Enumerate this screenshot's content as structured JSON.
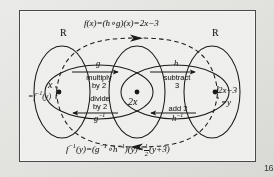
{
  "diagram": {
    "title_formula": {
      "full": "f(x)=(h∘g)(x)=2x−3",
      "f_of_x": "f(x)",
      "composition": "=(h∘g)(x)",
      "result": "=2x−3"
    },
    "bottom_formula": {
      "full": "f⁻¹(y)=(g⁻¹∘h⁻¹)(y)=½(y+3)",
      "f_inverse": "f",
      "f_inverse_exp": "−1",
      "f_inverse_arg": "(y)=(",
      "g_inverse": "g",
      "g_inverse_exp": "−1",
      "compose": "∘",
      "h_inverse": "h",
      "h_inverse_exp": "−1",
      "closing": ")(y)=",
      "frac_num": "1",
      "frac_den": "2",
      "tail": "(y+3)"
    },
    "set_labels": {
      "left": "R",
      "right": "R"
    },
    "nodes": {
      "left": {
        "value": "x",
        "sub_prefix": "=f",
        "sub_exp": "−1",
        "sub_arg": "(y)"
      },
      "middle": {
        "value": "2x"
      },
      "right": {
        "value": "2x−3",
        "sub": "=y"
      }
    },
    "maps": {
      "forward_left": {
        "name": "g",
        "description_line1": "multiply",
        "description_line2": "by 2"
      },
      "forward_right": {
        "name": "h",
        "description_line1": "subtract",
        "description_line2": "3"
      },
      "inverse_left": {
        "name": "g",
        "name_exp": "−1",
        "description_line1": "divide",
        "description_line2": "by 2"
      },
      "inverse_right": {
        "name": "h",
        "name_exp": "−1",
        "description_line1": "add 3",
        "description_line2": ""
      }
    },
    "page_number": "16",
    "colors": {
      "ink": "#1a1a1a",
      "paper": "#f2f2f0",
      "background": "#e6e6e3",
      "frame": "#4a4a4a"
    }
  }
}
